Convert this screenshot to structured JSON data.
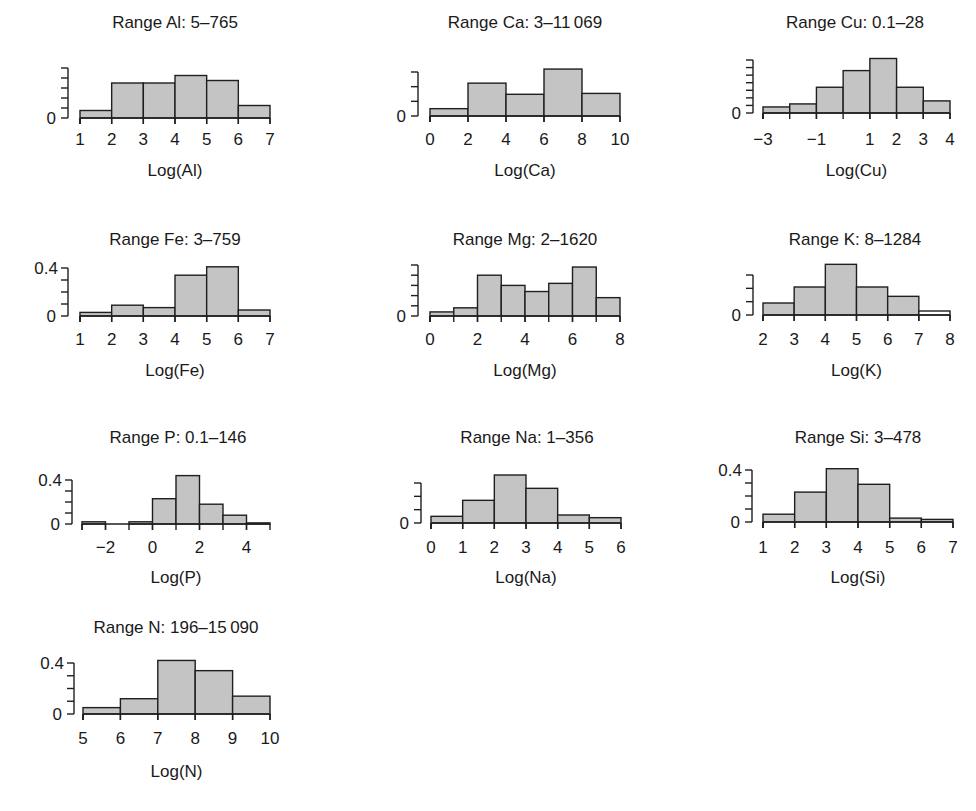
{
  "chart_data": [
    {
      "type": "bar",
      "title": "Range Al: 5–765",
      "xlabel": "Log(Al)",
      "ylabel": "",
      "bin_edges": [
        1,
        2,
        3,
        4,
        5,
        6,
        7
      ],
      "values": [
        0.03,
        0.14,
        0.14,
        0.17,
        0.15,
        0.05
      ],
      "xticks": [
        "1",
        "2",
        "3",
        "4",
        "5",
        "6",
        "7"
      ],
      "xtick_values": [
        1,
        2,
        3,
        4,
        5,
        6,
        7
      ],
      "xlim": [
        1,
        7
      ],
      "yticks": [
        "0"
      ],
      "ytick_count": 6,
      "ylim": [
        0,
        0.2
      ]
    },
    {
      "type": "bar",
      "title": "Range Ca: 3–11 069",
      "xlabel": "Log(Ca)",
      "ylabel": "",
      "bin_edges": [
        0,
        2,
        4,
        6,
        8,
        10
      ],
      "values": [
        0.025,
        0.112,
        0.074,
        0.16,
        0.077
      ],
      "xticks": [
        "0",
        "2",
        "4",
        "6",
        "8",
        "10"
      ],
      "xtick_values": [
        0,
        2,
        4,
        6,
        8,
        10
      ],
      "xlim": [
        0,
        10
      ],
      "yticks": [
        "0"
      ],
      "ytick_count": 4,
      "ylim": [
        0,
        0.15
      ]
    },
    {
      "type": "bar",
      "title": "Range Cu: 0.1–28",
      "xlabel": "Log(Cu)",
      "ylabel": "",
      "bin_edges": [
        -3,
        -2,
        -1,
        0,
        1,
        2,
        3,
        4
      ],
      "values": [
        0.04,
        0.06,
        0.17,
        0.28,
        0.36,
        0.17,
        0.08
      ],
      "xticks": [
        "−3",
        "−1",
        "1",
        "2",
        "3",
        "4"
      ],
      "xtick_values": [
        -3,
        -1,
        1,
        2,
        3,
        4
      ],
      "xlim": [
        -3,
        4
      ],
      "yticks": [
        "0"
      ],
      "ytick_count": 8,
      "ylim": [
        0,
        0.35
      ]
    },
    {
      "type": "bar",
      "title": "Range Fe: 3–759",
      "xlabel": "Log(Fe)",
      "ylabel": "",
      "bin_edges": [
        1,
        2,
        3,
        4,
        5,
        6,
        7
      ],
      "values": [
        0.03,
        0.09,
        0.07,
        0.34,
        0.41,
        0.05
      ],
      "xticks": [
        "1",
        "2",
        "3",
        "4",
        "5",
        "6",
        "7"
      ],
      "xtick_values": [
        1,
        2,
        3,
        4,
        5,
        6,
        7
      ],
      "xlim": [
        1,
        7
      ],
      "yticks": [
        "0",
        "0.4"
      ],
      "ytick_count": 5,
      "ylim": [
        0,
        0.4
      ]
    },
    {
      "type": "bar",
      "title": "Range Mg: 2–1620",
      "xlabel": "Log(Mg)",
      "ylabel": "",
      "bin_edges": [
        0,
        1,
        2,
        3,
        4,
        5,
        6,
        7,
        8
      ],
      "values": [
        0.02,
        0.04,
        0.2,
        0.15,
        0.12,
        0.16,
        0.24,
        0.09
      ],
      "xticks": [
        "0",
        "2",
        "4",
        "6",
        "8"
      ],
      "xtick_values": [
        0,
        2,
        4,
        6,
        8
      ],
      "xlim": [
        0,
        8
      ],
      "yticks": [
        "0"
      ],
      "ytick_count": 6,
      "ylim": [
        0,
        0.25
      ]
    },
    {
      "type": "bar",
      "title": "Range K: 8–1284",
      "xlabel": "Log(K)",
      "ylabel": "",
      "bin_edges": [
        2,
        3,
        4,
        5,
        6,
        7,
        8
      ],
      "values": [
        0.09,
        0.21,
        0.38,
        0.21,
        0.14,
        0.03
      ],
      "xticks": [
        "2",
        "3",
        "4",
        "5",
        "6",
        "7",
        "8"
      ],
      "xtick_values": [
        2,
        3,
        4,
        5,
        6,
        7,
        8
      ],
      "xlim": [
        2,
        8
      ],
      "yticks": [
        "0"
      ],
      "ytick_count": 4,
      "ylim": [
        0,
        0.3
      ]
    },
    {
      "type": "bar",
      "title": "Range P: 0.1–146",
      "xlabel": "Log(P)",
      "ylabel": "",
      "bin_edges": [
        -3,
        -2,
        -1,
        0,
        1,
        2,
        3,
        4,
        5
      ],
      "values": [
        0.02,
        0.0,
        0.02,
        0.23,
        0.44,
        0.18,
        0.08,
        0.01
      ],
      "xticks": [
        "−2",
        "0",
        "2",
        "4"
      ],
      "xtick_values": [
        -2,
        0,
        2,
        4
      ],
      "xlim": [
        -3,
        5
      ],
      "yticks": [
        "0",
        "0.4"
      ],
      "ytick_count": 5,
      "ylim": [
        0,
        0.4
      ]
    },
    {
      "type": "bar",
      "title": "Range Na: 1–356",
      "xlabel": "Log(Na)",
      "ylabel": "",
      "bin_edges": [
        0,
        1,
        2,
        3,
        4,
        5,
        6
      ],
      "values": [
        0.05,
        0.17,
        0.36,
        0.26,
        0.06,
        0.04
      ],
      "xticks": [
        "0",
        "1",
        "2",
        "3",
        "4",
        "5",
        "6"
      ],
      "xtick_values": [
        0,
        1,
        2,
        3,
        4,
        5,
        6
      ],
      "xlim": [
        0,
        6
      ],
      "yticks": [
        "0"
      ],
      "ytick_count": 4,
      "ylim": [
        0,
        0.3
      ]
    },
    {
      "type": "bar",
      "title": "Range Si: 3–478",
      "xlabel": "Log(Si)",
      "ylabel": "",
      "bin_edges": [
        1,
        2,
        3,
        4,
        5,
        6,
        7
      ],
      "values": [
        0.06,
        0.23,
        0.41,
        0.29,
        0.03,
        0.02
      ],
      "xticks": [
        "1",
        "2",
        "3",
        "4",
        "5",
        "6",
        "7"
      ],
      "xtick_values": [
        1,
        2,
        3,
        4,
        5,
        6,
        7
      ],
      "xlim": [
        1,
        7
      ],
      "yticks": [
        "0",
        "0.4"
      ],
      "ytick_count": 5,
      "ylim": [
        0,
        0.4
      ]
    },
    {
      "type": "bar",
      "title": "Range N: 196–15 090",
      "xlabel": "Log(N)",
      "ylabel": "",
      "bin_edges": [
        5,
        6,
        7,
        8,
        9,
        10
      ],
      "values": [
        0.05,
        0.12,
        0.42,
        0.34,
        0.14
      ],
      "xticks": [
        "5",
        "6",
        "7",
        "8",
        "9",
        "10"
      ],
      "xtick_values": [
        5,
        6,
        7,
        8,
        9,
        10
      ],
      "xlim": [
        5,
        10
      ],
      "yticks": [
        "0",
        "0.4"
      ],
      "ytick_count": 5,
      "ylim": [
        0,
        0.4
      ]
    }
  ],
  "layout": {
    "panels": [
      {
        "x0": 80,
        "x1": 270,
        "base": 118,
        "top": 68,
        "yaxis": 68,
        "titley": 28,
        "ticky": 145,
        "xlabely": 176,
        "titlex": 175
      },
      {
        "x0": 430,
        "x1": 620,
        "base": 116,
        "top": 72,
        "yaxis": 418,
        "titley": 28,
        "ticky": 145,
        "xlabely": 176,
        "titlex": 525
      },
      {
        "x0": 763,
        "x1": 950,
        "base": 113,
        "top": 60,
        "yaxis": 753,
        "titley": 28,
        "ticky": 145,
        "xlabely": 176,
        "titlex": 855
      },
      {
        "x0": 80,
        "x1": 270,
        "base": 316,
        "top": 268,
        "yaxis": 68,
        "titley": 245,
        "ticky": 345,
        "xlabely": 376,
        "titlex": 175
      },
      {
        "x0": 430,
        "x1": 620,
        "base": 316,
        "top": 265,
        "yaxis": 418,
        "titley": 245,
        "ticky": 345,
        "xlabely": 376,
        "titlex": 525
      },
      {
        "x0": 763,
        "x1": 950,
        "base": 315,
        "top": 275,
        "yaxis": 753,
        "titley": 245,
        "ticky": 345,
        "xlabely": 376,
        "titlex": 855
      },
      {
        "x0": 82,
        "x1": 270,
        "base": 524,
        "top": 480,
        "yaxis": 72,
        "titley": 443,
        "ticky": 553,
        "xlabely": 583,
        "titlex": 178
      },
      {
        "x0": 431,
        "x1": 621,
        "base": 523,
        "top": 483,
        "yaxis": 421,
        "titley": 443,
        "ticky": 553,
        "xlabely": 583,
        "titlex": 527
      },
      {
        "x0": 763,
        "x1": 953,
        "base": 522,
        "top": 470,
        "yaxis": 752,
        "titley": 443,
        "ticky": 553,
        "xlabely": 583,
        "titlex": 858
      },
      {
        "x0": 83,
        "x1": 270,
        "base": 714,
        "top": 663,
        "yaxis": 74,
        "titley": 633,
        "ticky": 744,
        "xlabely": 777,
        "titlex": 176
      }
    ]
  }
}
